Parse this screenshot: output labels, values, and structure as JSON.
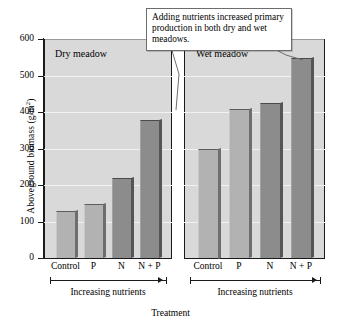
{
  "chart_data": {
    "type": "bar",
    "title": "",
    "xlabel": "Treatment",
    "ylabel": "Aboveground biomass (g/m2)",
    "ylabel_display": "Aboveground biomass (g/m",
    "ylabel_sup": "2",
    "ylabel_tail": ")",
    "ylim": [
      0,
      600
    ],
    "yticks": [
      0,
      100,
      200,
      300,
      400,
      500,
      600
    ],
    "ytick_labels": [
      "0",
      "100",
      "200",
      "300",
      "400",
      "500",
      "600"
    ],
    "grid": true,
    "legend": "none",
    "categories": [
      "Control",
      "P",
      "N",
      "N + P"
    ],
    "panels": [
      {
        "name": "dry",
        "label": "Dry meadow",
        "axis_note": "Increasing nutrients",
        "values": [
          128,
          147,
          219,
          377
        ],
        "bar_shades": [
          "light",
          "light",
          "dark",
          "dark"
        ]
      },
      {
        "name": "wet",
        "label": "Wet meadow",
        "axis_note": "Increasing nutrients",
        "values": [
          300,
          409,
          424,
          548
        ],
        "bar_shades": [
          "light",
          "light",
          "dark",
          "dark"
        ]
      }
    ],
    "annotation": {
      "text": "Adding nutrients increased primary production in both dry and wet meadows.",
      "points_to": [
        "dry N + P bar",
        "wet N + P bar"
      ]
    },
    "colors": {
      "panel_background": "#d9d9d9",
      "gridline": "#f2f2f2",
      "bar_light": "#b2b2b2",
      "bar_dark": "#8c8c8c",
      "bar_side": "#6e6e6e",
      "axis": "#1a1a1a",
      "callout_background": "#ffffff",
      "callout_border": "#6d6d6d",
      "text": "#000000"
    }
  }
}
